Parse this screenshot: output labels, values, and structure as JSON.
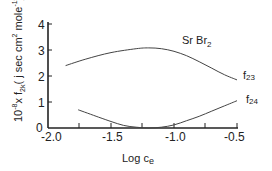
{
  "chart_data": {
    "type": "line",
    "title_main": "Sr Br",
    "title_sub": "2",
    "xlabel": "Log c",
    "xlabel_sub": "e",
    "ylabel": "10^-8 x f_2k ( j sec cm^2 mole^-1 )",
    "xlim": [
      -2.0,
      -0.5
    ],
    "ylim": [
      0,
      4
    ],
    "x_ticks": [
      "-2.0",
      "-1.5",
      "-1.0",
      "-0.5"
    ],
    "y_ticks": [
      "0",
      "1",
      "2",
      "3",
      "4"
    ],
    "grid": false,
    "series": [
      {
        "name": "f23",
        "x": [
          -1.86,
          -1.7,
          -1.5,
          -1.3,
          -1.2,
          -1.1,
          -1.0,
          -0.9,
          -0.8,
          -0.7,
          -0.6,
          -0.5
        ],
        "y": [
          2.4,
          2.65,
          2.9,
          3.05,
          3.08,
          3.05,
          2.95,
          2.78,
          2.55,
          2.3,
          2.05,
          1.85
        ]
      },
      {
        "name": "f24",
        "x": [
          -1.76,
          -1.6,
          -1.5,
          -1.4,
          -1.3,
          -1.2,
          -1.1,
          -1.0,
          -0.9,
          -0.8,
          -0.7,
          -0.6,
          -0.5
        ],
        "y": [
          0.7,
          0.42,
          0.25,
          0.1,
          0.03,
          0.0,
          0.03,
          0.12,
          0.28,
          0.45,
          0.65,
          0.85,
          1.05
        ]
      }
    ]
  },
  "labels": {
    "y_axis_prefix": "10",
    "y_axis_exp": "-8",
    "y_axis_rest": "x f",
    "y_axis_sub": "2k",
    "y_axis_units": "( j sec cm",
    "y_axis_units_exp": "2",
    "y_axis_units_tail": " mole",
    "y_axis_units_exp2": "-1",
    "y_axis_close": ")",
    "series_f23_main": "f",
    "series_f23_sub": "23",
    "series_f24_main": "f",
    "series_f24_sub": "24"
  }
}
